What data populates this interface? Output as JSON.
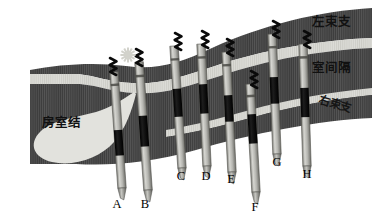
{
  "figure": {
    "width": 372,
    "height": 224,
    "background": "#ffffff"
  },
  "colors": {
    "myocardium_dark": "#3c3c3c",
    "myocardium_stripe": "#585858",
    "conduction_light": "#d9d9d4",
    "av_node_fill": "#e2e2dd",
    "lead_shaft": "#b9b9b4",
    "lead_band_black": "#111111",
    "lead_tip": "#8d8d88",
    "helix_black": "#080808",
    "spark_fill": "#cfcfc8",
    "text_black": "#111111"
  },
  "anatomy_labels": [
    {
      "id": "left-bundle-branch",
      "text": "左束支",
      "x": 312,
      "y": 26,
      "style": "cjk-label"
    },
    {
      "id": "interventricular-septum",
      "text": "室间隔",
      "x": 312,
      "y": 72,
      "style": "cjk-label"
    },
    {
      "id": "right-bundle-branch",
      "text": "右束支",
      "x": 318,
      "y": 103,
      "style": "cjk-label-small",
      "rotate": 17
    },
    {
      "id": "av-node",
      "text": "房室结",
      "x": 42,
      "y": 127,
      "style": "cjk-label"
    }
  ],
  "leads": [
    {
      "letter": "A",
      "label_x": 117,
      "label_y": 208,
      "top_x": 114,
      "top_y": 72,
      "bottom_x": 122,
      "bottom_y": 188,
      "width": 8.4,
      "angle": 4,
      "band_start": 0.5,
      "band_end": 0.72,
      "helix_x": 110,
      "helix_y": 58,
      "spark": false
    },
    {
      "letter": "B",
      "label_x": 145,
      "label_y": 208,
      "top_x": 139,
      "top_y": 62,
      "bottom_x": 148,
      "bottom_y": 190,
      "width": 8.6,
      "angle": 4,
      "band_start": 0.42,
      "band_end": 0.66,
      "helix_x": 136,
      "helix_y": 49,
      "spark": true
    },
    {
      "letter": "C",
      "label_x": 181,
      "label_y": 180,
      "top_x": 174,
      "top_y": 46,
      "bottom_x": 182,
      "bottom_y": 168,
      "width": 8.4,
      "angle": 4,
      "band_start": 0.35,
      "band_end": 0.58,
      "helix_x": 175,
      "helix_y": 33,
      "spark": false
    },
    {
      "letter": "D",
      "label_x": 206,
      "label_y": 180,
      "top_x": 201,
      "top_y": 44,
      "bottom_x": 207,
      "bottom_y": 166,
      "width": 8.4,
      "angle": 3,
      "band_start": 0.33,
      "band_end": 0.57,
      "helix_x": 202,
      "helix_y": 31,
      "spark": false
    },
    {
      "letter": "E",
      "label_x": 231,
      "label_y": 183,
      "top_x": 226,
      "top_y": 52,
      "bottom_x": 232,
      "bottom_y": 172,
      "width": 8.4,
      "angle": 3,
      "band_start": 0.36,
      "band_end": 0.58,
      "helix_x": 227,
      "helix_y": 39,
      "spark": false
    },
    {
      "letter": "F",
      "label_x": 255,
      "label_y": 211,
      "top_x": 250,
      "top_y": 84,
      "bottom_x": 256,
      "bottom_y": 192,
      "width": 8.4,
      "angle": 3,
      "band_start": 0.28,
      "band_end": 0.55,
      "helix_x": 251,
      "helix_y": 71,
      "spark": false
    },
    {
      "letter": "G",
      "label_x": 277,
      "label_y": 166,
      "top_x": 272,
      "top_y": 34,
      "bottom_x": 277,
      "bottom_y": 154,
      "width": 8.4,
      "angle": 2,
      "band_start": 0.36,
      "band_end": 0.58,
      "helix_x": 273,
      "helix_y": 21,
      "spark": false
    },
    {
      "letter": "H",
      "label_x": 307,
      "label_y": 178,
      "top_x": 303,
      "top_y": 44,
      "bottom_x": 307,
      "bottom_y": 166,
      "width": 8.4,
      "angle": 2,
      "band_start": 0.36,
      "band_end": 0.6,
      "helix_x": 304,
      "helix_y": 31,
      "spark": false
    }
  ],
  "tissue_bands": {
    "septum_upper_note": "dark striped myocardium sweeping from lower-left to upper-right",
    "conduction_note": "light band representing His bundle / left bundle branch",
    "av_node_note": "light teardrop shaped atrioventricular node at left"
  }
}
